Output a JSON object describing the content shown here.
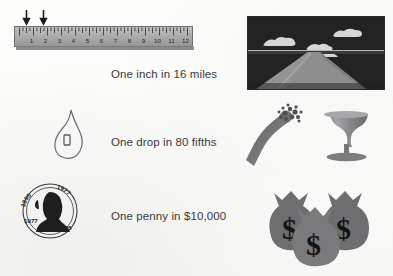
{
  "document": {
    "title": "Precision Analogies Illustration",
    "background_color": "#fbfbfa"
  },
  "rows": [
    {
      "id": "inch-miles",
      "label": "One inch in 16 miles",
      "left_illustration": "ruler-with-two-arrows",
      "right_illustration": "highway-road-photo"
    },
    {
      "id": "drop-fifths",
      "label": "One drop in 80 fifths",
      "left_illustration": "water-drop-outline",
      "right_illustration": "bottle-and-goblet"
    },
    {
      "id": "penny-dollars",
      "label": "One penny in $10,000",
      "left_illustration": "lincoln-penny",
      "right_illustration": "three-money-bags"
    }
  ],
  "ruler": {
    "numbers": [
      "1",
      "2",
      "3",
      "4",
      "5",
      "6",
      "7",
      "8",
      "9",
      "10",
      "11",
      "12"
    ],
    "unit_count": 12,
    "marker_arrows": 2,
    "body_color": "#a9a9a7",
    "tick_color": "#3d3d3f"
  },
  "penny": {
    "top_legend_left": "1895",
    "top_legend_right": "1977",
    "left_date": "1977",
    "right_date": "1895",
    "portrait": "lincoln-silhouette"
  },
  "money_bags": {
    "count": 3,
    "symbol": "$",
    "bag_color": "#6e6e70",
    "symbol_color": "#141414"
  },
  "road": {
    "sky_color": "#242424",
    "road_color": "#8e8e8e",
    "cloud_color": "#d8d8d8"
  },
  "bottle_glass": {
    "bottle_color": "#6f6f71",
    "glass_color": "#8f8f91"
  }
}
